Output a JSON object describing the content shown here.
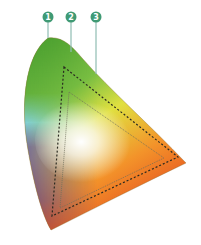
{
  "diagram": {
    "type": "cie-chromaticity-gamut",
    "callouts": [
      {
        "id": "1",
        "label": "1",
        "target": "spectral-locus",
        "x": 48,
        "y": 17,
        "line_end_y": 38
      },
      {
        "id": "2",
        "label": "2",
        "target": "outer-dashed-gamut",
        "x": 71,
        "y": 17,
        "line_end_y": 52
      },
      {
        "id": "3",
        "label": "3",
        "target": "inner-gamut",
        "x": 96,
        "y": 17,
        "line_end_y": 72
      }
    ],
    "colors": {
      "callout_fill": "#3f9a74",
      "callout_line": "#8fbdb3",
      "green": "#3e9a2a",
      "cyan": "#7fd0e6",
      "purple": "#5b3a8c",
      "red": "#e2371c",
      "orange": "#f3932a",
      "yellow": "#e8e23a",
      "outline": "#8a6a2a"
    },
    "gamuts": [
      {
        "name": "outer-dashed",
        "style": "dashed",
        "points": [
          [
            64,
            67
          ],
          [
            178,
            157
          ],
          [
            52,
            216
          ]
        ]
      },
      {
        "name": "inner",
        "style": "thin-dotted",
        "points": [
          [
            69,
            92
          ],
          [
            164,
            158
          ],
          [
            60,
            208
          ]
        ]
      }
    ]
  }
}
